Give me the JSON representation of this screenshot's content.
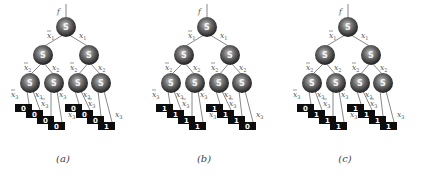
{
  "figure": {
    "output_label": "f",
    "node_label": "S",
    "edge_labels": {
      "level1": {
        "neg": "x1",
        "pos": "x1"
      },
      "level2": {
        "neg": "x2",
        "pos": "x2"
      },
      "level3": {
        "neg": "x3",
        "pos": "x3"
      }
    },
    "panels": [
      {
        "caption": "(a)",
        "leaves": [
          "0",
          "0",
          "0",
          "0",
          "0",
          "0",
          "0",
          "1"
        ]
      },
      {
        "caption": "(b)",
        "leaves": [
          "1",
          "1",
          "1",
          "1",
          "1",
          "1",
          "1",
          "0"
        ]
      },
      {
        "caption": "(c)",
        "leaves": [
          "0",
          "1",
          "1",
          "1",
          "1",
          "1",
          "1",
          "1"
        ]
      }
    ]
  }
}
